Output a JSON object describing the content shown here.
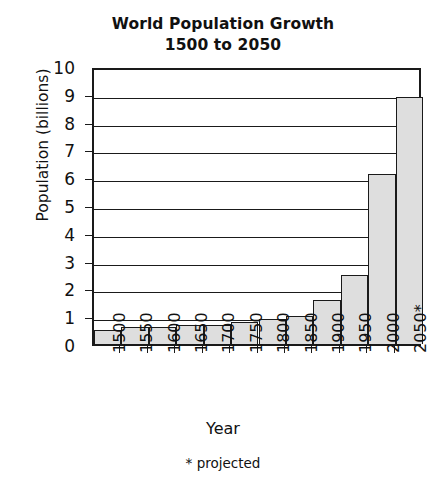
{
  "chart_data": {
    "type": "bar",
    "title": "World Population Growth\n1500 to 2050",
    "title_line1": "World Population Growth",
    "title_line2": "1500 to 2050",
    "xlabel": "Year",
    "ylabel": "Population (billions)",
    "categories": [
      "1500",
      "1550",
      "1600",
      "1650",
      "1700",
      "1750",
      "1800",
      "1850",
      "1900",
      "1950",
      "2000",
      "2050*"
    ],
    "values": [
      0.5,
      0.6,
      0.6,
      0.7,
      0.7,
      0.8,
      0.9,
      1.0,
      1.6,
      2.5,
      6.1,
      8.9
    ],
    "ylim": [
      0,
      10
    ],
    "ytick_labels": [
      "0",
      "1",
      "2",
      "3",
      "4",
      "5",
      "6",
      "7",
      "8",
      "9",
      "10"
    ],
    "ytick_values": [
      0,
      1,
      2,
      3,
      4,
      5,
      6,
      7,
      8,
      9,
      10
    ],
    "grid": "horizontal",
    "legend": "none",
    "annotation": "* projected",
    "bar_fill_color": "#dedede",
    "bar_edge_color": "#1a1a1a",
    "axis_color": "#1a1a1a",
    "background_color": "#ffffff"
  },
  "footnote": {
    "text": "* projected"
  }
}
